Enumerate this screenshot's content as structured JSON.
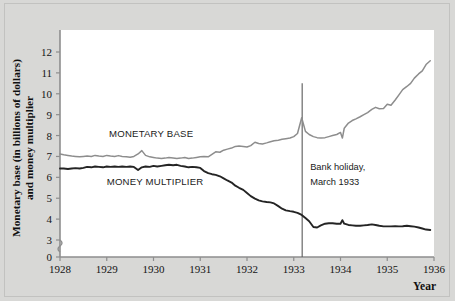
{
  "figure": {
    "background_color": "#d8d8d6",
    "plot_background_color": "#ffffff",
    "border_color": "#c2c2c0"
  },
  "annotations": {
    "bank_holiday": {
      "line1": "Bank holiday,",
      "line2": "March 1933",
      "x_value": 1933.18
    }
  },
  "labels": {
    "monetary_base": "MONETARY BASE",
    "money_multiplier": "MONEY MULTIPLIER",
    "ylabel_line1": "Monetary base (in billions of dollars)",
    "ylabel_line2": "and money multiplier",
    "xlabel": "Year"
  },
  "chart_data": {
    "type": "line",
    "title": "",
    "xlabel": "Year",
    "ylabel": "Monetary base (in billions of dollars) and money multiplier",
    "xlim": [
      1928,
      1936
    ],
    "ylim": [
      0,
      12
    ],
    "yticks": [
      0,
      3,
      4,
      5,
      6,
      7,
      8,
      9,
      10,
      11,
      12
    ],
    "ytick_labels": [
      "0",
      "3",
      "4",
      "5",
      "6",
      "7",
      "8",
      "9",
      "10",
      "11",
      "12"
    ],
    "y_axis_break_between": [
      0,
      3
    ],
    "xticks": [
      1928,
      1929,
      1930,
      1931,
      1932,
      1933,
      1934,
      1935,
      1936
    ],
    "xtick_labels": [
      "1928",
      "1929",
      "1930",
      "1931",
      "1932",
      "1933",
      "1934",
      "1935",
      "1936"
    ],
    "grid": false,
    "legend_position": "inline-labels",
    "annotations": [
      {
        "text": "Bank holiday, March 1933",
        "type": "vertical-line",
        "x": 1933.18,
        "y_top": 10.5,
        "color": "#5a5a5a"
      }
    ],
    "series": [
      {
        "name": "MONETARY BASE",
        "color": "#8d8d8d",
        "label_x": 1929.05,
        "label_y": 7.95,
        "x": [
          1928.0,
          1928.08,
          1928.17,
          1928.25,
          1928.33,
          1928.42,
          1928.5,
          1928.58,
          1928.67,
          1928.75,
          1928.83,
          1928.92,
          1929.0,
          1929.08,
          1929.17,
          1929.25,
          1929.33,
          1929.42,
          1929.5,
          1929.58,
          1929.67,
          1929.75,
          1929.83,
          1929.92,
          1930.0,
          1930.08,
          1930.17,
          1930.25,
          1930.33,
          1930.42,
          1930.5,
          1930.58,
          1930.67,
          1930.75,
          1930.83,
          1930.92,
          1931.0,
          1931.08,
          1931.17,
          1931.25,
          1931.33,
          1931.42,
          1931.5,
          1931.58,
          1931.67,
          1931.75,
          1931.83,
          1931.92,
          1932.0,
          1932.08,
          1932.17,
          1932.25,
          1932.33,
          1932.42,
          1932.5,
          1932.58,
          1932.67,
          1932.75,
          1932.83,
          1932.92,
          1933.0,
          1933.08,
          1933.17,
          1933.25,
          1933.33,
          1933.42,
          1933.5,
          1933.58,
          1933.67,
          1933.75,
          1933.83,
          1933.92,
          1934.0,
          1934.04,
          1934.08,
          1934.17,
          1934.25,
          1934.33,
          1934.42,
          1934.5,
          1934.58,
          1934.67,
          1934.75,
          1934.83,
          1934.92,
          1935.0,
          1935.08,
          1935.17,
          1935.25,
          1935.33,
          1935.42,
          1935.5,
          1935.58,
          1935.67,
          1935.75,
          1935.83,
          1935.92
        ],
        "y": [
          7.12,
          7.08,
          7.05,
          7.02,
          7.0,
          6.98,
          7.0,
          7.02,
          7.0,
          7.05,
          7.02,
          7.0,
          7.05,
          7.02,
          7.0,
          7.04,
          7.0,
          6.98,
          6.96,
          7.0,
          7.12,
          7.28,
          7.05,
          6.98,
          6.95,
          6.92,
          6.9,
          6.92,
          6.95,
          6.93,
          6.9,
          6.92,
          6.95,
          6.9,
          6.92,
          6.95,
          6.98,
          7.0,
          6.98,
          7.1,
          7.22,
          7.2,
          7.3,
          7.35,
          7.4,
          7.48,
          7.5,
          7.48,
          7.45,
          7.52,
          7.68,
          7.62,
          7.6,
          7.65,
          7.7,
          7.75,
          7.78,
          7.82,
          7.85,
          7.88,
          7.95,
          8.1,
          8.85,
          8.2,
          8.05,
          7.95,
          7.9,
          7.88,
          7.9,
          7.95,
          8.0,
          8.05,
          8.15,
          7.88,
          8.35,
          8.6,
          8.72,
          8.8,
          8.9,
          9.0,
          9.1,
          9.25,
          9.35,
          9.28,
          9.3,
          9.5,
          9.45,
          9.7,
          9.95,
          10.2,
          10.35,
          10.5,
          10.75,
          10.95,
          11.1,
          11.4,
          11.58
        ]
      },
      {
        "name": "MONEY MULTIPLIER",
        "color": "#242424",
        "label_x": 1929.0,
        "label_y": 5.62,
        "x": [
          1928.0,
          1928.08,
          1928.17,
          1928.25,
          1928.33,
          1928.42,
          1928.5,
          1928.58,
          1928.67,
          1928.75,
          1928.83,
          1928.92,
          1929.0,
          1929.08,
          1929.17,
          1929.25,
          1929.33,
          1929.42,
          1929.5,
          1929.58,
          1929.67,
          1929.75,
          1929.83,
          1929.92,
          1930.0,
          1930.08,
          1930.17,
          1930.25,
          1930.33,
          1930.42,
          1930.5,
          1930.58,
          1930.67,
          1930.75,
          1930.83,
          1930.92,
          1931.0,
          1931.08,
          1931.17,
          1931.25,
          1931.33,
          1931.42,
          1931.5,
          1931.58,
          1931.67,
          1931.75,
          1931.83,
          1931.92,
          1932.0,
          1932.08,
          1932.17,
          1932.25,
          1932.33,
          1932.42,
          1932.5,
          1932.58,
          1932.67,
          1932.75,
          1932.83,
          1932.92,
          1933.0,
          1933.08,
          1933.17,
          1933.25,
          1933.33,
          1933.42,
          1933.5,
          1933.58,
          1933.67,
          1933.75,
          1933.83,
          1933.92,
          1934.0,
          1934.04,
          1934.08,
          1934.17,
          1934.25,
          1934.33,
          1934.42,
          1934.5,
          1934.58,
          1934.67,
          1934.75,
          1934.83,
          1934.92,
          1935.0,
          1935.08,
          1935.17,
          1935.25,
          1935.33,
          1935.42,
          1935.5,
          1935.58,
          1935.67,
          1935.75,
          1935.83,
          1935.92
        ],
        "y": [
          6.42,
          6.42,
          6.4,
          6.42,
          6.44,
          6.42,
          6.45,
          6.5,
          6.48,
          6.52,
          6.5,
          6.48,
          6.52,
          6.5,
          6.52,
          6.5,
          6.52,
          6.5,
          6.52,
          6.5,
          6.35,
          6.48,
          6.52,
          6.5,
          6.55,
          6.52,
          6.55,
          6.58,
          6.6,
          6.58,
          6.6,
          6.55,
          6.52,
          6.48,
          6.5,
          6.48,
          6.45,
          6.3,
          6.2,
          6.15,
          6.12,
          6.05,
          5.95,
          5.85,
          5.75,
          5.6,
          5.5,
          5.4,
          5.25,
          5.1,
          4.98,
          4.9,
          4.85,
          4.82,
          4.8,
          4.75,
          4.62,
          4.5,
          4.42,
          4.38,
          4.35,
          4.3,
          4.2,
          4.05,
          3.9,
          3.62,
          3.6,
          3.7,
          3.78,
          3.8,
          3.8,
          3.78,
          3.78,
          3.95,
          3.78,
          3.72,
          3.7,
          3.68,
          3.68,
          3.7,
          3.72,
          3.75,
          3.72,
          3.68,
          3.65,
          3.65,
          3.65,
          3.66,
          3.65,
          3.66,
          3.68,
          3.66,
          3.64,
          3.6,
          3.55,
          3.5,
          3.48
        ]
      }
    ]
  }
}
